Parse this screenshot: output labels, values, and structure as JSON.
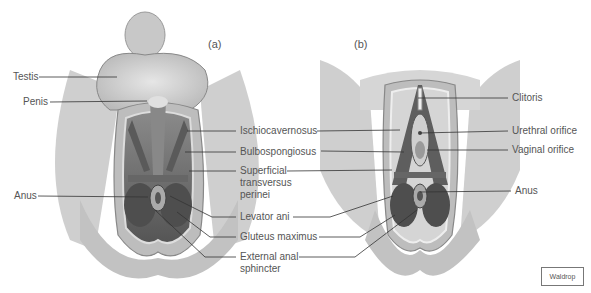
{
  "figure": {
    "panels": [
      {
        "tag": "(a)",
        "subject": "male perineum"
      },
      {
        "tag": "(b)",
        "subject": "female perineum"
      }
    ],
    "left_labels": {
      "testis": "Testis",
      "penis": "Penis",
      "anus": "Anus"
    },
    "center_labels": {
      "ischiocavernosus": "Ischiocavernosus",
      "bulbospongiosus": "Bulbospongiosus",
      "superficial_1": "Superficial",
      "superficial_2": "transversus",
      "superficial_3": "perinei",
      "levator_ani": "Levator ani",
      "gluteus_maximus": "Gluteus maximus",
      "external_anal_1": "External anal",
      "external_anal_2": "sphincter"
    },
    "right_labels": {
      "clitoris": "Clitoris",
      "urethral_orifice": "Urethral orifice",
      "vaginal_orifice": "Vaginal orifice",
      "anus": "Anus"
    },
    "credit": "Waldrop"
  },
  "colors": {
    "skin": "#d9d9d9",
    "skin_dark": "#a8a8a8",
    "muscle": "#6e6e6e",
    "muscle_dark": "#4a4a4a",
    "leader": "#333333",
    "text": "#555555"
  }
}
